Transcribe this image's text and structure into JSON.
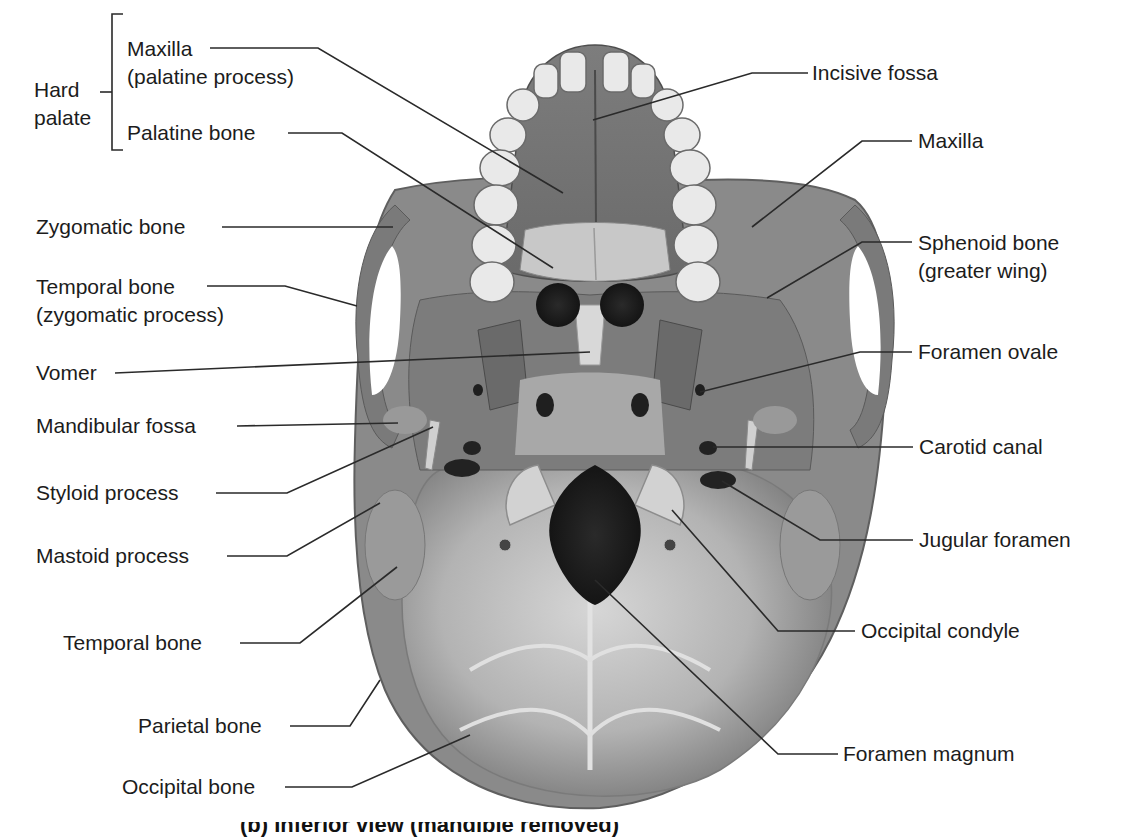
{
  "figure": {
    "group_label": {
      "line1": "Hard",
      "line2": "palate"
    },
    "labels_left": [
      {
        "id": "maxilla-palatine",
        "line1": "Maxilla",
        "line2": "(palatine process)"
      },
      {
        "id": "palatine-bone",
        "line1": "Palatine bone"
      },
      {
        "id": "zygomatic-bone",
        "line1": "Zygomatic bone"
      },
      {
        "id": "temporal-zygomatic",
        "line1": "Temporal bone",
        "line2": "(zygomatic process)"
      },
      {
        "id": "vomer",
        "line1": "Vomer"
      },
      {
        "id": "mandibular-fossa",
        "line1": "Mandibular fossa"
      },
      {
        "id": "styloid-process",
        "line1": "Styloid process"
      },
      {
        "id": "mastoid-process",
        "line1": "Mastoid process"
      },
      {
        "id": "temporal-bone",
        "line1": "Temporal bone"
      },
      {
        "id": "parietal-bone",
        "line1": "Parietal bone"
      },
      {
        "id": "occipital-bone",
        "line1": "Occipital bone"
      }
    ],
    "labels_right": [
      {
        "id": "incisive-fossa",
        "line1": "Incisive fossa"
      },
      {
        "id": "maxilla",
        "line1": "Maxilla"
      },
      {
        "id": "sphenoid-greater-wing",
        "line1": "Sphenoid bone",
        "line2": "(greater wing)"
      },
      {
        "id": "foramen-ovale",
        "line1": "Foramen ovale"
      },
      {
        "id": "carotid-canal",
        "line1": "Carotid canal"
      },
      {
        "id": "jugular-foramen",
        "line1": "Jugular foramen"
      },
      {
        "id": "occipital-condyle",
        "line1": "Occipital condyle"
      },
      {
        "id": "foramen-magnum",
        "line1": "Foramen magnum"
      }
    ],
    "caption_partial": "(b) Inferior view (mandible removed)"
  },
  "colors": {
    "bone_dark": "#6e6e6e",
    "bone_mid": "#8f8f8f",
    "bone_light": "#c4c4c4",
    "teeth": "#e9e9e9",
    "holes": "#1e1e1e",
    "leader": "#2a2a2a"
  }
}
